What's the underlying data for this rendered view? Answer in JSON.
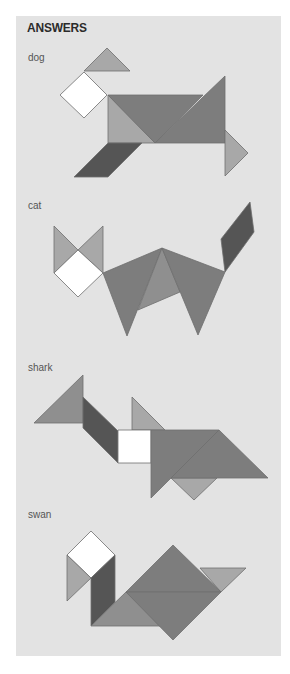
{
  "title": "ANSWERS",
  "colors": {
    "panel": "#e3e3e3",
    "light": "#a8a8a8",
    "medium": "#8f8f8f",
    "mid_dark": "#7d7d7d",
    "dark": "#555555",
    "white": "#ffffff",
    "stroke": "#6e6e6e"
  },
  "figures": [
    {
      "name": "dog",
      "label": "dog",
      "label_top": 52,
      "pieces": [
        {
          "shape": "small-triangle",
          "tone": "light",
          "points": "107,48 84,71 130,71"
        },
        {
          "shape": "square",
          "tone": "white",
          "points": "84,72 60,95 84,118 107,95"
        },
        {
          "shape": "medium-triangle",
          "tone": "light",
          "points": "108,95 108,143 155,143"
        },
        {
          "shape": "large-triangle",
          "tone": "mid_dark",
          "points": "108,95 203,95 155,143"
        },
        {
          "shape": "large-triangle",
          "tone": "mid_dark",
          "points": "225,76 225,143 155,143"
        },
        {
          "shape": "small-triangle",
          "tone": "light",
          "points": "225,130 248,153 225,176"
        },
        {
          "shape": "parallelogram",
          "tone": "dark",
          "points": "108,143 142,143 108,177 74,177"
        }
      ]
    },
    {
      "name": "cat",
      "label": "cat",
      "label_top": 200,
      "pieces": [
        {
          "shape": "small-triangle",
          "tone": "light",
          "points": "54,226 54,273 78,250"
        },
        {
          "shape": "small-triangle",
          "tone": "light",
          "points": "103,226 103,273 78,250"
        },
        {
          "shape": "square",
          "tone": "white",
          "points": "78,250 54,273 78,297 103,273"
        },
        {
          "shape": "large-triangle",
          "tone": "mid_dark",
          "points": "103,273 162,248 127,336"
        },
        {
          "shape": "medium-triangle",
          "tone": "medium",
          "points": "162,248 138,310 180,292"
        },
        {
          "shape": "large-triangle",
          "tone": "mid_dark",
          "points": "162,248 225,272 198,335"
        },
        {
          "shape": "parallelogram",
          "tone": "dark",
          "points": "221,239 250,202 254,232 225,272"
        }
      ]
    },
    {
      "name": "shark",
      "label": "shark",
      "label_top": 362,
      "pieces": [
        {
          "shape": "medium-triangle",
          "tone": "medium",
          "points": "83,375 83,423 34,423"
        },
        {
          "shape": "parallelogram",
          "tone": "dark",
          "points": "83,397 83,428 118,463 118,431"
        },
        {
          "shape": "small-triangle",
          "tone": "light",
          "points": "132,397 132,430 165,430"
        },
        {
          "shape": "square",
          "tone": "white",
          "points": "118,430 151,430 151,463 118,463"
        },
        {
          "shape": "small-triangle",
          "tone": "light",
          "points": "171,478 217,478 194,500"
        },
        {
          "shape": "large-triangle",
          "tone": "mid_dark",
          "points": "151,430 219,430 151,498"
        },
        {
          "shape": "large-triangle",
          "tone": "mid_dark",
          "points": "219,430 268,478 171,478"
        }
      ]
    },
    {
      "name": "swan",
      "label": "swan",
      "label_top": 509,
      "pieces": [
        {
          "shape": "square",
          "tone": "white",
          "points": "91,531 67,555 91,578 115,555"
        },
        {
          "shape": "small-triangle",
          "tone": "light",
          "points": "67,555 91,578 67,601"
        },
        {
          "shape": "parallelogram",
          "tone": "dark",
          "points": "91,578 115,555 115,602 91,626"
        },
        {
          "shape": "medium-triangle",
          "tone": "medium",
          "points": "91,626 126,592 164,626"
        },
        {
          "shape": "small-triangle",
          "tone": "light",
          "points": "200,568 246,568 221,592"
        },
        {
          "shape": "large-triangle",
          "tone": "mid_dark",
          "points": "126,592 173,545 221,592"
        },
        {
          "shape": "large-triangle",
          "tone": "mid_dark",
          "points": "126,592 221,592 173,640"
        }
      ]
    }
  ]
}
